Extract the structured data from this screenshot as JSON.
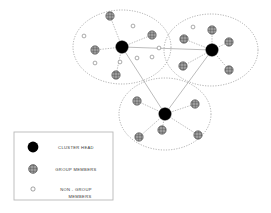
{
  "figure": {
    "type": "network-cluster-diagram",
    "background": "#ffffff",
    "colors": {
      "cluster_head": "#000000",
      "group_member_fill": "#9a9a9a",
      "group_member_stroke": "#4a4a4a",
      "non_group_member_stroke": "#666666",
      "non_group_member_fill": "#ffffff",
      "cluster_boundary": "#8c8c8c",
      "link": "#8f8f8f",
      "legend_border": "#b8b8b8",
      "legend_text": "#3a3a3a"
    }
  },
  "legend": {
    "box": {
      "x": 14,
      "y": 132,
      "width": 99,
      "height": 68
    },
    "rows": [
      {
        "symbol": "cluster-head",
        "label": "CLUSTER HEAD",
        "label2": ""
      },
      {
        "symbol": "group-member",
        "label": "GROUP MEMBERS",
        "label2": ""
      },
      {
        "symbol": "non-group-member",
        "label": "NON - GROUP",
        "label2": "MEMBERS"
      }
    ]
  },
  "clusters": [
    {
      "id": "cluster-left",
      "name": "left-cluster",
      "boundary": {
        "cx": 122,
        "cy": 47,
        "rx": 49,
        "ry": 37
      },
      "head": {
        "cx": 122,
        "cy": 47,
        "r": 6.2
      },
      "group_members": [
        {
          "cx": 110,
          "cy": 16,
          "r": 4.2
        },
        {
          "cx": 152,
          "cy": 35,
          "r": 4.2
        },
        {
          "cx": 95,
          "cy": 50,
          "r": 4.2
        },
        {
          "cx": 116,
          "cy": 75,
          "r": 4.2
        }
      ],
      "non_group_members": [
        {
          "cx": 84,
          "cy": 36,
          "r": 1.9
        },
        {
          "cx": 133,
          "cy": 26,
          "r": 1.9
        },
        {
          "cx": 95,
          "cy": 63,
          "r": 1.9
        },
        {
          "cx": 120,
          "cy": 62,
          "r": 1.9
        },
        {
          "cx": 137,
          "cy": 58,
          "r": 1.9
        },
        {
          "cx": 152,
          "cy": 57,
          "r": 1.9
        },
        {
          "cx": 159,
          "cy": 48,
          "r": 1.9
        }
      ]
    },
    {
      "id": "cluster-right",
      "name": "right-cluster",
      "boundary": {
        "cx": 211,
        "cy": 50,
        "rx": 47,
        "ry": 36
      },
      "head": {
        "cx": 212,
        "cy": 50,
        "r": 6.2
      },
      "group_members": [
        {
          "cx": 212,
          "cy": 30,
          "r": 4.2
        },
        {
          "cx": 184,
          "cy": 39,
          "r": 4.2
        },
        {
          "cx": 229,
          "cy": 42,
          "r": 4.2
        },
        {
          "cx": 183,
          "cy": 66,
          "r": 4.2
        },
        {
          "cx": 229,
          "cy": 70,
          "r": 4.2
        }
      ],
      "non_group_members": [
        {
          "cx": 193,
          "cy": 27,
          "r": 1.9
        }
      ]
    },
    {
      "id": "cluster-bottom",
      "name": "bottom-cluster",
      "boundary": {
        "cx": 165,
        "cy": 114,
        "rx": 46,
        "ry": 36
      },
      "head": {
        "cx": 165,
        "cy": 114,
        "r": 6.2
      },
      "group_members": [
        {
          "cx": 137,
          "cy": 101,
          "r": 4.2
        },
        {
          "cx": 195,
          "cy": 104,
          "r": 4.2
        },
        {
          "cx": 162,
          "cy": 130,
          "r": 4.2
        },
        {
          "cx": 139,
          "cy": 137,
          "r": 4.2
        },
        {
          "cx": 198,
          "cy": 135,
          "r": 4.2
        }
      ],
      "non_group_members": []
    }
  ],
  "inter_cluster_links": [
    {
      "from": "cluster-left",
      "to": "cluster-right",
      "x1": 122,
      "y1": 47,
      "x2": 212,
      "y2": 50
    },
    {
      "from": "cluster-left",
      "to": "cluster-bottom",
      "x1": 122,
      "y1": 47,
      "x2": 165,
      "y2": 114
    },
    {
      "from": "cluster-right",
      "to": "cluster-bottom",
      "x1": 212,
      "y1": 50,
      "x2": 165,
      "y2": 114
    }
  ]
}
